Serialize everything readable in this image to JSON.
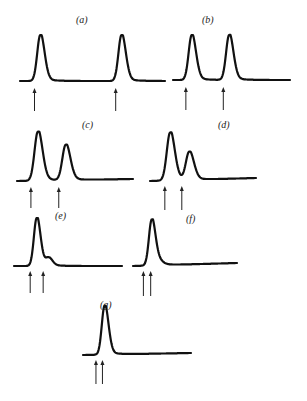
{
  "figure": {
    "panels": [
      {
        "id": "a",
        "label": "(a)",
        "peaks": [
          {
            "pos": 0.14,
            "height": 1.0
          },
          {
            "pos": 0.7,
            "height": 1.0
          }
        ],
        "arrows": [
          0.1,
          0.66
        ]
      },
      {
        "id": "b",
        "label": "(b)",
        "peaks": [
          {
            "pos": 0.16,
            "height": 1.0
          },
          {
            "pos": 0.48,
            "height": 1.0
          }
        ],
        "arrows": [
          0.11,
          0.43
        ]
      },
      {
        "id": "c",
        "label": "(c)",
        "peaks": [
          {
            "pos": 0.18,
            "height": 1.0
          },
          {
            "pos": 0.42,
            "height": 0.72
          }
        ],
        "arrows": [
          0.12,
          0.36
        ]
      },
      {
        "id": "d",
        "label": "(d)",
        "peaks": [
          {
            "pos": 0.19,
            "height": 1.0
          },
          {
            "pos": 0.37,
            "height": 0.58
          }
        ],
        "arrows": [
          0.14,
          0.3
        ]
      },
      {
        "id": "e",
        "label": "(e)",
        "peaks": [
          {
            "pos": 0.21,
            "height": 1.0
          },
          {
            "pos": 0.32,
            "height": 0.16
          }
        ],
        "arrows": [
          0.15,
          0.27
        ]
      },
      {
        "id": "f",
        "label": "(f)",
        "peaks": [
          {
            "pos": 0.18,
            "height": 1.0
          },
          {
            "pos": 0.26,
            "height": 0.06
          }
        ],
        "arrows": [
          0.1,
          0.17
        ]
      },
      {
        "id": "g",
        "label": "(g)",
        "peaks": [
          {
            "pos": 0.2,
            "height": 1.0
          }
        ],
        "arrows": [
          0.12,
          0.18
        ]
      }
    ]
  }
}
